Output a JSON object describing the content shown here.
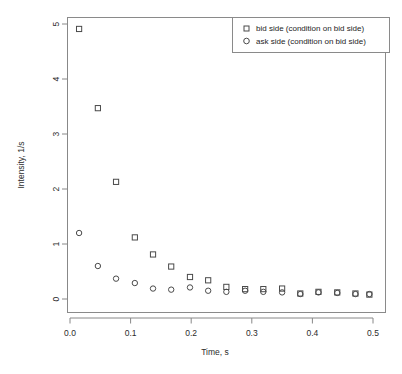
{
  "chart_data": {
    "type": "scatter",
    "title": "",
    "xlabel": "Time, s",
    "ylabel": "Intensity, 1/s",
    "xlim": [
      -0.012,
      0.512
    ],
    "ylim": [
      -0.12,
      5.18
    ],
    "xticks": [
      "0.0",
      "0.1",
      "0.2",
      "0.3",
      "0.4",
      "0.5"
    ],
    "xtick_values": [
      0.0,
      0.1,
      0.2,
      0.3,
      0.4,
      0.5
    ],
    "yticks": [
      "0",
      "1",
      "2",
      "3",
      "4",
      "5"
    ],
    "ytick_values": [
      0,
      1,
      2,
      3,
      4,
      5
    ],
    "grid": false,
    "legend_position": "top-right",
    "series": [
      {
        "name": "bid side (condition on bid side)",
        "marker": "square",
        "color": "#4a4a4a",
        "x": [
          0.015,
          0.046,
          0.076,
          0.107,
          0.137,
          0.167,
          0.198,
          0.228,
          0.258,
          0.289,
          0.319,
          0.35,
          0.38,
          0.41,
          0.441,
          0.471,
          0.494
        ],
        "y": [
          4.91,
          3.47,
          2.13,
          1.12,
          0.81,
          0.59,
          0.4,
          0.34,
          0.22,
          0.18,
          0.18,
          0.19,
          0.1,
          0.13,
          0.12,
          0.1,
          0.08
        ]
      },
      {
        "name": "ask side (condition on bid side)",
        "marker": "circle",
        "color": "#4a4a4a",
        "x": [
          0.015,
          0.046,
          0.076,
          0.107,
          0.137,
          0.167,
          0.198,
          0.228,
          0.258,
          0.289,
          0.319,
          0.35,
          0.38,
          0.41,
          0.441,
          0.471,
          0.494
        ],
        "y": [
          1.2,
          0.6,
          0.37,
          0.29,
          0.19,
          0.17,
          0.21,
          0.15,
          0.13,
          0.15,
          0.13,
          0.12,
          0.09,
          0.12,
          0.11,
          0.09,
          0.09
        ]
      }
    ]
  },
  "legend": {
    "entries": [
      {
        "label": "bid side (condition on bid side)",
        "marker": "square"
      },
      {
        "label": "ask side (condition on bid side)",
        "marker": "circle"
      }
    ]
  },
  "axes": {
    "x_title": "Time, s",
    "y_title": "Intensity, 1/s"
  }
}
